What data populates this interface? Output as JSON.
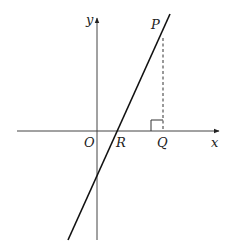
{
  "diagram": {
    "type": "coordinate-geometry",
    "axes": {
      "x_label": "x",
      "y_label": "y",
      "origin_label": "O"
    },
    "points": {
      "P": "P",
      "Q": "Q",
      "R": "R"
    },
    "elements": [
      {
        "kind": "line",
        "description": "straight line with positive gradient through R and P"
      },
      {
        "kind": "dashed-segment",
        "description": "vertical dashed line from P down to Q on x-axis"
      },
      {
        "kind": "right-angle-marker",
        "description": "right angle at Q"
      }
    ],
    "colors": {
      "stroke": "#222222",
      "background": "#ffffff"
    }
  }
}
